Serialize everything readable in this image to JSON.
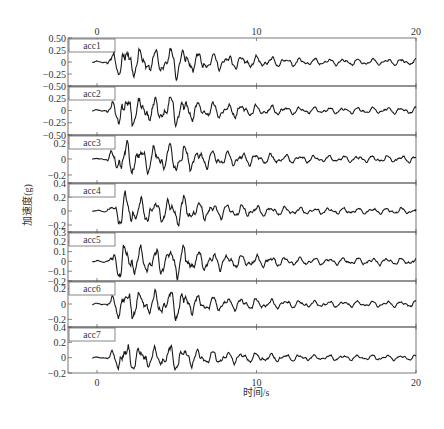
{
  "chart_data": {
    "type": "line",
    "title": "",
    "xlabel": "时间/s",
    "ylabel": "加速度(g)",
    "xlim": [
      0,
      20
    ],
    "x_ticks": [
      0,
      10,
      20
    ],
    "x_tick_labels": [
      "0",
      "10",
      "20"
    ],
    "grid": false,
    "legend_position": "upper-left of each panel",
    "series": [
      {
        "name": "acc1",
        "ylim": [
          -0.5,
          0.5
        ],
        "y_ticks": [
          0.5,
          0.25,
          0,
          -0.25,
          -0.5
        ],
        "y_tick_labels": [
          "0.50",
          "0.25",
          "0",
          "−0.25",
          "−0.50"
        ],
        "peak": 0.42,
        "seed": 11
      },
      {
        "name": "acc2",
        "ylim": [
          -0.5,
          0.5
        ],
        "y_ticks": [
          0.25,
          0,
          -0.25,
          -0.5
        ],
        "y_tick_labels": [
          "0.25",
          "0",
          "−0.25",
          "−0.50"
        ],
        "peak": 0.4,
        "seed": 23
      },
      {
        "name": "acc3",
        "ylim": [
          -0.3,
          0.3
        ],
        "y_ticks": [
          0.2,
          0,
          -0.2
        ],
        "y_tick_labels": [
          "0.2",
          "0",
          "−0.2"
        ],
        "peak": 0.26,
        "seed": 37
      },
      {
        "name": "acc4",
        "ylim": [
          -0.3,
          0.4
        ],
        "y_ticks": [
          0.4,
          0.2,
          0,
          -0.2
        ],
        "y_tick_labels": [
          "0.4",
          "0.2",
          "0",
          "−0.2"
        ],
        "peak": 0.28,
        "seed": 41
      },
      {
        "name": "acc5",
        "ylim": [
          -0.2,
          0.3
        ],
        "y_ticks": [
          0.3,
          0.2,
          0.1,
          0,
          -0.1,
          -0.2
        ],
        "y_tick_labels": [
          "0.3",
          "0.2",
          "0.1",
          "0",
          "−0.1",
          "−0.2"
        ],
        "peak": 0.22,
        "seed": 53
      },
      {
        "name": "acc6",
        "ylim": [
          -0.3,
          0.3
        ],
        "y_ticks": [
          0.2,
          0,
          -0.2
        ],
        "y_tick_labels": [
          "0.2",
          "0",
          "−0.2"
        ],
        "peak": 0.25,
        "seed": 67
      },
      {
        "name": "acc7",
        "ylim": [
          -0.2,
          0.4
        ],
        "y_ticks": [
          0.4,
          0.2,
          0,
          -0.2
        ],
        "y_tick_labels": [
          "0.4",
          "0.2",
          "0",
          "−0.2"
        ],
        "peak": 0.22,
        "seed": 79
      }
    ],
    "signal_description": "Seismic acceleration time histories, quiet until ~0.5 s, strong-motion peak near 1.5–2 s, secondary burst near 5 s, decaying coda to 20 s"
  },
  "layout": {
    "plot_left": 68,
    "plot_right": 416,
    "panel_tops": [
      38,
      86,
      135,
      183,
      232,
      281,
      327
    ],
    "plot_bottom": 373,
    "x0_px": 97,
    "x20_px": 416
  },
  "colors": {
    "trace": "#1a1a1a",
    "axis": "#555555",
    "text": "#333333"
  }
}
